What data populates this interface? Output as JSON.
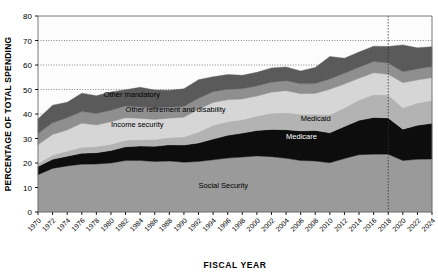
{
  "chart_data": {
    "type": "area",
    "title": "",
    "xlabel": "FISCAL YEAR",
    "ylabel": "PERCENTAGE OF TOTAL SPENDING",
    "ylim": [
      0,
      80
    ],
    "yticks": [
      0,
      10,
      20,
      30,
      40,
      50,
      60,
      70,
      80
    ],
    "grid": "horizontal-dotted",
    "legend": "inline-annotations",
    "xlim": [
      1970,
      2024
    ],
    "categories": [
      1970,
      1972,
      1974,
      1976,
      1978,
      1980,
      1982,
      1984,
      1986,
      1988,
      1990,
      1992,
      1994,
      1996,
      1998,
      2000,
      2002,
      2004,
      2006,
      2008,
      2010,
      2012,
      2014,
      2016,
      2018,
      2020,
      2022,
      2024
    ],
    "xticks": [
      "1970",
      "1972",
      "1974",
      "1976",
      "1978",
      "1980",
      "1982",
      "1984",
      "1986",
      "1988",
      "1990",
      "1992",
      "1994",
      "1996",
      "1998",
      "2000",
      "2002",
      "2004",
      "2006",
      "2008",
      "2010",
      "2012",
      "2014",
      "2016",
      "2018",
      "2020",
      "2022",
      "2024"
    ],
    "stack_order_bottom_to_top": [
      "Social Security",
      "Medicare",
      "Medicaid",
      "Income security",
      "Other retirement and disability",
      "Other mandatory"
    ],
    "series": [
      {
        "name": "Social Security",
        "color": "#9a9a9a",
        "values": [
          15.2,
          17.8,
          18.8,
          19.5,
          19.6,
          20.0,
          21.0,
          21.0,
          20.6,
          20.8,
          20.3,
          20.6,
          21.3,
          22.0,
          22.4,
          22.9,
          22.6,
          21.9,
          21.0,
          20.8,
          20.1,
          21.8,
          23.4,
          23.6,
          23.6,
          21.0,
          21.5,
          21.6
        ]
      },
      {
        "name": "Medicare",
        "color": "#0d0d0d",
        "values": [
          3.4,
          3.7,
          4.0,
          4.5,
          4.6,
          5.1,
          5.6,
          5.9,
          6.2,
          6.6,
          7.0,
          7.6,
          8.5,
          9.3,
          9.8,
          10.4,
          11.1,
          11.7,
          12.1,
          12.5,
          12.2,
          13.1,
          14.0,
          15.0,
          14.8,
          12.8,
          13.9,
          14.6
        ]
      },
      {
        "name": "Medicaid",
        "color": "#b3b3b3",
        "values": [
          1.2,
          1.8,
          2.1,
          2.4,
          2.5,
          2.6,
          2.7,
          2.7,
          2.8,
          3.0,
          3.4,
          4.5,
          5.6,
          5.6,
          5.5,
          5.9,
          6.6,
          7.0,
          6.8,
          6.6,
          7.4,
          7.7,
          8.3,
          9.4,
          9.4,
          8.8,
          9.1,
          9.4
        ]
      },
      {
        "name": "Income security",
        "color": "#d6d6d6",
        "values": [
          7.6,
          8.3,
          8.6,
          9.8,
          8.8,
          9.1,
          9.2,
          8.6,
          8.2,
          7.9,
          8.0,
          9.2,
          9.3,
          8.9,
          8.4,
          8.1,
          8.6,
          8.9,
          8.4,
          8.5,
          10.4,
          9.6,
          8.9,
          8.8,
          8.4,
          10.2,
          9.4,
          9.2
        ]
      },
      {
        "name": "Other retirement and disability",
        "color": "#8f8f8f",
        "values": [
          4.6,
          4.8,
          5.0,
          4.8,
          4.7,
          4.7,
          4.8,
          4.7,
          4.6,
          4.5,
          4.4,
          4.5,
          4.4,
          4.3,
          4.2,
          4.1,
          4.1,
          4.1,
          4.0,
          4.0,
          4.2,
          4.4,
          4.5,
          4.6,
          4.6,
          4.4,
          4.5,
          4.6
        ]
      },
      {
        "name": "Other mandatory",
        "color": "#5a5a5a",
        "values": [
          6.0,
          7.2,
          6.3,
          7.5,
          7.3,
          7.5,
          6.6,
          8.0,
          7.4,
          6.9,
          7.2,
          7.6,
          6.1,
          6.0,
          5.5,
          5.6,
          5.8,
          5.6,
          5.3,
          6.6,
          9.2,
          6.2,
          6.2,
          6.3,
          6.8,
          11.0,
          8.6,
          8.1
        ]
      }
    ],
    "annotations": [
      {
        "text": "Other mandatory",
        "x_year": 1979,
        "y_value": 47.0,
        "style": "dark"
      },
      {
        "text": "Other retirement and disability",
        "x_year": 1982,
        "y_value": 41.0,
        "style": "dark"
      },
      {
        "text": "Income security",
        "x_year": 1980,
        "y_value": 34.5,
        "style": "dark"
      },
      {
        "text": "Medicaid",
        "x_year": 2006,
        "y_value": 37.0,
        "style": "dark"
      },
      {
        "text": "Medicare",
        "x_year": 2004,
        "y_value": 30.0,
        "style": "light"
      },
      {
        "text": "Social Security",
        "x_year": 1992,
        "y_value": 10.0,
        "style": "dark"
      }
    ],
    "reference_line": {
      "x_year": 2018,
      "style": "dotted-vertical"
    }
  }
}
